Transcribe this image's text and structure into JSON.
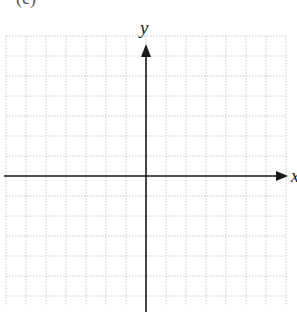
{
  "figure": {
    "clipped_label": "(c)",
    "axes": {
      "x_label": "x",
      "y_label": "y"
    },
    "grid": {
      "style": "dotted",
      "color": "#c8c8c8",
      "columns": 14,
      "rows": 13
    },
    "axis_color": "#1a1a1a"
  }
}
